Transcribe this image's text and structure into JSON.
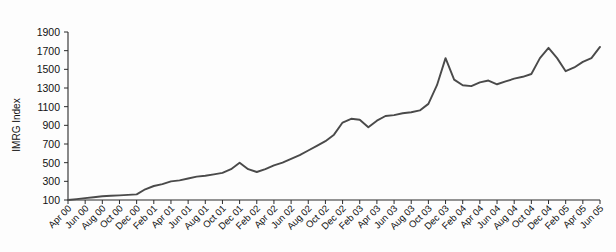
{
  "chart_data": {
    "type": "line",
    "title": "",
    "subtitle": "",
    "xlabel": "",
    "ylabel": "IMRG Index",
    "ylim": [
      100,
      1900
    ],
    "y_ticks": [
      100,
      300,
      500,
      700,
      900,
      1100,
      1300,
      1500,
      1700,
      1900
    ],
    "grid": false,
    "legend": null,
    "legend_position": "none",
    "line_color": "#4a4a4a",
    "background_color": "#fdfdfd",
    "axis_color": "#2b2b2b",
    "x_tick_labels": [
      "Apr 00",
      "Jun 00",
      "Aug 00",
      "Oct 00",
      "Dec 00",
      "Feb 01",
      "Apr 01",
      "Jun 01",
      "Aug 01",
      "Oct 01",
      "Dec 01",
      "Feb 02",
      "Apr 02",
      "Jun 02",
      "Aug 02",
      "Oct 02",
      "Dec 02",
      "Feb 03",
      "Apr 03",
      "Jun 03",
      "Aug 03",
      "Oct 03",
      "Dec 03",
      "Feb 04",
      "Apr 04",
      "Jun 04",
      "Aug 04",
      "Oct 04",
      "Dec 04",
      "Feb 05",
      "Apr 05",
      "Jun 05"
    ],
    "x": [
      "Apr 00",
      "May 00",
      "Jun 00",
      "Jul 00",
      "Aug 00",
      "Sep 00",
      "Oct 00",
      "Nov 00",
      "Dec 00",
      "Jan 01",
      "Feb 01",
      "Mar 01",
      "Apr 01",
      "May 01",
      "Jun 01",
      "Jul 01",
      "Aug 01",
      "Sep 01",
      "Oct 01",
      "Nov 01",
      "Dec 01",
      "Jan 02",
      "Feb 02",
      "Mar 02",
      "Apr 02",
      "May 02",
      "Jun 02",
      "Jul 02",
      "Aug 02",
      "Sep 02",
      "Oct 02",
      "Nov 02",
      "Dec 02",
      "Jan 03",
      "Feb 03",
      "Mar 03",
      "Apr 03",
      "May 03",
      "Jun 03",
      "Jul 03",
      "Aug 03",
      "Sep 03",
      "Oct 03",
      "Nov 03",
      "Dec 03",
      "Jan 04",
      "Feb 04",
      "Mar 04",
      "Apr 04",
      "May 04",
      "Jun 04",
      "Jul 04",
      "Aug 04",
      "Sep 04",
      "Oct 04",
      "Nov 04",
      "Dec 04",
      "Jan 05",
      "Feb 05",
      "Mar 05",
      "Apr 05",
      "May 05",
      "Jun 05"
    ],
    "values": [
      100,
      110,
      120,
      130,
      140,
      145,
      150,
      155,
      160,
      215,
      250,
      270,
      300,
      310,
      330,
      350,
      360,
      375,
      390,
      430,
      500,
      430,
      400,
      430,
      470,
      500,
      540,
      580,
      630,
      680,
      730,
      800,
      930,
      970,
      960,
      880,
      950,
      1000,
      1010,
      1030,
      1040,
      1060,
      1130,
      1330,
      1620,
      1390,
      1330,
      1320,
      1360,
      1380,
      1340,
      1370,
      1400,
      1420,
      1450,
      1620,
      1730,
      1620,
      1480,
      1520,
      1580,
      1620,
      1740
    ]
  },
  "axis": {
    "y_title": "IMRG Index"
  }
}
